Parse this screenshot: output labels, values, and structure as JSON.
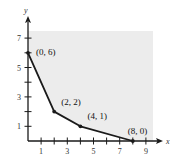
{
  "chart_data": {
    "type": "line",
    "title": "",
    "xlabel": "x",
    "ylabel": "y",
    "xlim": [
      0,
      9.5
    ],
    "ylim": [
      0,
      7.5
    ],
    "grid": false,
    "x_ticks": [
      1,
      2,
      3,
      4,
      5,
      6,
      7,
      8,
      9
    ],
    "x_tick_labels": [
      "1",
      "3",
      "5",
      "7",
      "9"
    ],
    "x_tick_label_values": [
      1,
      3,
      5,
      7,
      9
    ],
    "y_ticks": [
      1,
      2,
      3,
      4,
      5,
      6,
      7
    ],
    "y_tick_labels": [
      "1",
      "3",
      "5",
      "7"
    ],
    "y_tick_label_values": [
      1,
      3,
      5,
      7
    ],
    "series": [
      {
        "name": "boundary",
        "points": [
          {
            "x": 0,
            "y": 6,
            "label": "(0, 6)"
          },
          {
            "x": 2,
            "y": 2,
            "label": "(2, 2)"
          },
          {
            "x": 4,
            "y": 1,
            "label": "(4, 1)"
          },
          {
            "x": 8,
            "y": 0,
            "label": "(8, 0)"
          }
        ]
      }
    ],
    "shaded_region": "unbounded feasible region above/right of boundary, shaded light gray",
    "colors": {
      "shade": "#ececec",
      "line": "#1a1a1a",
      "axis": "#1a1a1a"
    }
  }
}
